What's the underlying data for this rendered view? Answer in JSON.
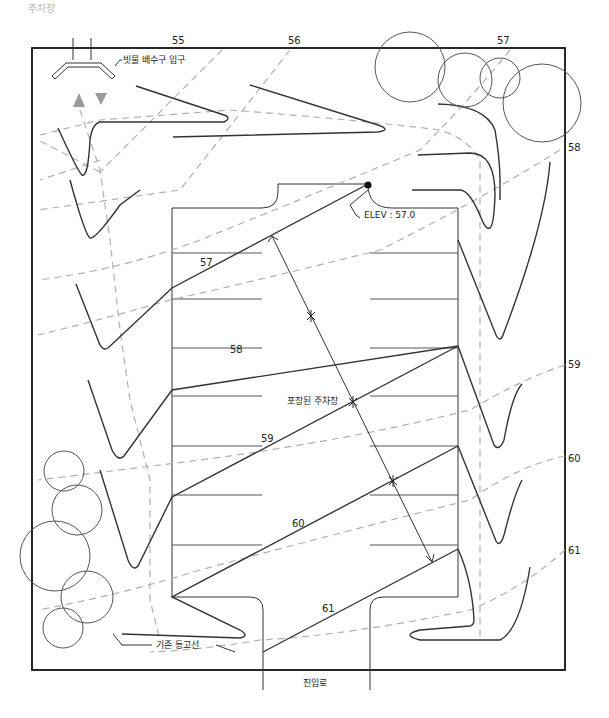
{
  "figure": {
    "corner_title": "주차장"
  },
  "labels": {
    "storm_drain_inlet": "빗물 배수구 입구",
    "elevation": "ELEV : 57.0",
    "paved_parking": "포장된 주차장",
    "existing_contour": "기존 등고선",
    "access_road": "진입로"
  },
  "existing_contours": {
    "top": [
      "55",
      "56",
      "57"
    ],
    "right": [
      "58",
      "59",
      "60",
      "61"
    ]
  },
  "proposed_contours": [
    "57",
    "58",
    "59",
    "60",
    "61"
  ],
  "colors": {
    "line": "#333333",
    "dashed": "#b0b0b0",
    "arrow_gray": "#9a9a9a",
    "border": "#111111"
  }
}
